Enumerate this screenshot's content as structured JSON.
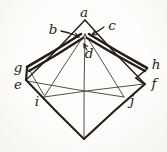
{
  "diagram": {
    "ink_color": "#221f1c",
    "thin_color": "#3f3b36",
    "paper_color": "#fbfaf7",
    "labels": [
      {
        "name": "point-a",
        "text": "a",
        "x": 84,
        "y": 13
      },
      {
        "name": "point-b",
        "text": "b",
        "x": 53,
        "y": 30
      },
      {
        "name": "point-c",
        "text": "c",
        "x": 112,
        "y": 26
      },
      {
        "name": "point-d",
        "text": "d",
        "x": 89,
        "y": 54
      },
      {
        "name": "point-g",
        "text": "g",
        "x": 18,
        "y": 68
      },
      {
        "name": "point-e",
        "text": "e",
        "x": 18,
        "y": 85
      },
      {
        "name": "point-h",
        "text": "h",
        "x": 156,
        "y": 65
      },
      {
        "name": "point-f",
        "text": "f",
        "x": 154,
        "y": 84
      },
      {
        "name": "point-i",
        "text": "i",
        "x": 37,
        "y": 102
      },
      {
        "name": "point-j",
        "text": "j",
        "x": 132,
        "y": 101
      }
    ],
    "segments": [
      {
        "name": "edge-a-e",
        "x1": 85,
        "y1": 20,
        "x2": 26,
        "y2": 80,
        "w": 1.4,
        "bow": -1.5,
        "tone": "ink"
      },
      {
        "name": "edge-a-f",
        "x1": 85,
        "y1": 20,
        "x2": 145,
        "y2": 84,
        "w": 1.4,
        "bow": 1.5,
        "tone": "ink"
      },
      {
        "name": "edge-e-b",
        "x1": 26,
        "y1": 80,
        "x2": 84,
        "y2": 139,
        "w": 2.0,
        "bow": 1,
        "tone": "ink"
      },
      {
        "name": "edge-f-b",
        "x1": 145,
        "y1": 84,
        "x2": 84,
        "y2": 139,
        "w": 2.2,
        "bow": 1,
        "tone": "ink"
      },
      {
        "name": "flap-left-outer-fold",
        "x1": 81,
        "y1": 34,
        "x2": 27,
        "y2": 67,
        "w": 2.6,
        "bow": -1,
        "tone": "ink"
      },
      {
        "name": "flap-left-inner-fold",
        "x1": 83,
        "y1": 38,
        "x2": 29,
        "y2": 71,
        "w": 2.4,
        "bow": -1,
        "tone": "ink"
      },
      {
        "name": "flap-left-corner",
        "x1": 27,
        "y1": 68,
        "x2": 26,
        "y2": 80,
        "w": 2.2,
        "bow": 0,
        "tone": "ink"
      },
      {
        "name": "flap-left-raw-edge",
        "x1": 29,
        "y1": 69,
        "x2": 44,
        "y2": 95,
        "w": 0.9,
        "bow": 0.5,
        "tone": "thin"
      },
      {
        "name": "flap-right-outer-fold",
        "x1": 89,
        "y1": 34,
        "x2": 147,
        "y2": 68,
        "w": 2.6,
        "bow": 1,
        "tone": "ink"
      },
      {
        "name": "flap-right-inner-fold",
        "x1": 87,
        "y1": 38,
        "x2": 145,
        "y2": 71,
        "w": 2.4,
        "bow": 1,
        "tone": "ink"
      },
      {
        "name": "flap-right-notch-upper",
        "x1": 147,
        "y1": 69,
        "x2": 136,
        "y2": 78,
        "w": 1.6,
        "bow": 0,
        "tone": "ink"
      },
      {
        "name": "flap-right-notch-lower",
        "x1": 136,
        "y1": 78,
        "x2": 144,
        "y2": 84,
        "w": 1.6,
        "bow": 0,
        "tone": "ink"
      },
      {
        "name": "crease-p-i",
        "x1": 85,
        "y1": 34,
        "x2": 44,
        "y2": 97,
        "w": 0.9,
        "bow": 0.5,
        "tone": "thin"
      },
      {
        "name": "crease-p-b",
        "x1": 85,
        "y1": 34,
        "x2": 84,
        "y2": 139,
        "w": 0.9,
        "bow": 0.8,
        "tone": "thin"
      },
      {
        "name": "crease-p-j",
        "x1": 85,
        "y1": 34,
        "x2": 124,
        "y2": 97,
        "w": 0.9,
        "bow": -0.5,
        "tone": "thin"
      },
      {
        "name": "crease-e-j",
        "x1": 27,
        "y1": 81,
        "x2": 124,
        "y2": 97,
        "w": 0.9,
        "bow": 1,
        "tone": "thin"
      },
      {
        "name": "crease-f-i",
        "x1": 144,
        "y1": 84,
        "x2": 44,
        "y2": 97,
        "w": 0.9,
        "bow": 1,
        "tone": "thin"
      },
      {
        "name": "leader-b",
        "x1": 61,
        "y1": 31,
        "x2": 77,
        "y2": 36,
        "w": 1.3,
        "bow": -1,
        "tone": "ink"
      },
      {
        "name": "leader-c",
        "x1": 104,
        "y1": 27,
        "x2": 93,
        "y2": 34,
        "w": 1.3,
        "bow": -0.5,
        "tone": "ink"
      },
      {
        "name": "leader-d",
        "x1": 87,
        "y1": 50,
        "x2": 84,
        "y2": 45,
        "w": 1.1,
        "bow": 0,
        "tone": "ink"
      }
    ],
    "arrowheads": [
      {
        "name": "arrowhead-b",
        "x": 79,
        "y": 37,
        "angle": 22,
        "size": 5
      },
      {
        "name": "arrowhead-c",
        "x": 92,
        "y": 35,
        "angle": 148,
        "size": 5
      },
      {
        "name": "arrowhead-d",
        "x": 84,
        "y": 44,
        "angle": -118,
        "size": 4
      }
    ]
  }
}
